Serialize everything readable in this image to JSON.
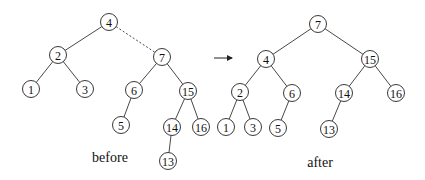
{
  "diagram": {
    "before": {
      "caption": "before",
      "nodes": [
        {
          "id": "4",
          "label": "4",
          "x": 109,
          "y": 22
        },
        {
          "id": "2",
          "label": "2",
          "x": 58,
          "y": 55
        },
        {
          "id": "7",
          "label": "7",
          "x": 162,
          "y": 57
        },
        {
          "id": "1",
          "label": "1",
          "x": 31,
          "y": 89
        },
        {
          "id": "3",
          "label": "3",
          "x": 85,
          "y": 89
        },
        {
          "id": "6",
          "label": "6",
          "x": 134,
          "y": 90
        },
        {
          "id": "15",
          "label": "15",
          "x": 188,
          "y": 91
        },
        {
          "id": "5",
          "label": "5",
          "x": 121,
          "y": 125
        },
        {
          "id": "14",
          "label": "14",
          "x": 172,
          "y": 127
        },
        {
          "id": "16",
          "label": "16",
          "x": 201,
          "y": 127
        },
        {
          "id": "13",
          "label": "13",
          "x": 168,
          "y": 161
        }
      ],
      "edges": [
        {
          "from": "4",
          "to": "2",
          "style": "solid"
        },
        {
          "from": "4",
          "to": "7",
          "style": "dashed"
        },
        {
          "from": "2",
          "to": "1",
          "style": "solid"
        },
        {
          "from": "2",
          "to": "3",
          "style": "solid"
        },
        {
          "from": "7",
          "to": "6",
          "style": "solid"
        },
        {
          "from": "7",
          "to": "15",
          "style": "solid"
        },
        {
          "from": "6",
          "to": "5",
          "style": "solid"
        },
        {
          "from": "15",
          "to": "14",
          "style": "solid"
        },
        {
          "from": "15",
          "to": "16",
          "style": "solid"
        },
        {
          "from": "14",
          "to": "13",
          "style": "solid"
        }
      ],
      "caption_pos": {
        "x": 110,
        "y": 162
      }
    },
    "arrow": {
      "x1": 214,
      "y1": 58,
      "x2": 232,
      "y2": 58
    },
    "after": {
      "caption": "after",
      "nodes": [
        {
          "id": "7",
          "label": "7",
          "x": 318,
          "y": 24
        },
        {
          "id": "4",
          "label": "4",
          "x": 266,
          "y": 59
        },
        {
          "id": "15",
          "label": "15",
          "x": 370,
          "y": 59
        },
        {
          "id": "2",
          "label": "2",
          "x": 240,
          "y": 92
        },
        {
          "id": "6",
          "label": "6",
          "x": 292,
          "y": 93
        },
        {
          "id": "14",
          "label": "14",
          "x": 344,
          "y": 93
        },
        {
          "id": "16",
          "label": "16",
          "x": 396,
          "y": 93
        },
        {
          "id": "1",
          "label": "1",
          "x": 226,
          "y": 127
        },
        {
          "id": "3",
          "label": "3",
          "x": 253,
          "y": 127
        },
        {
          "id": "5",
          "label": "5",
          "x": 278,
          "y": 128
        },
        {
          "id": "13",
          "label": "13",
          "x": 329,
          "y": 129
        }
      ],
      "edges": [
        {
          "from": "7",
          "to": "4",
          "style": "solid"
        },
        {
          "from": "7",
          "to": "15",
          "style": "solid"
        },
        {
          "from": "4",
          "to": "2",
          "style": "solid"
        },
        {
          "from": "4",
          "to": "6",
          "style": "solid"
        },
        {
          "from": "15",
          "to": "14",
          "style": "solid"
        },
        {
          "from": "15",
          "to": "16",
          "style": "solid"
        },
        {
          "from": "2",
          "to": "1",
          "style": "solid"
        },
        {
          "from": "2",
          "to": "3",
          "style": "solid"
        },
        {
          "from": "6",
          "to": "5",
          "style": "solid"
        },
        {
          "from": "14",
          "to": "13",
          "style": "solid"
        }
      ],
      "caption_pos": {
        "x": 320,
        "y": 167
      }
    },
    "node_radius": 8.5
  }
}
